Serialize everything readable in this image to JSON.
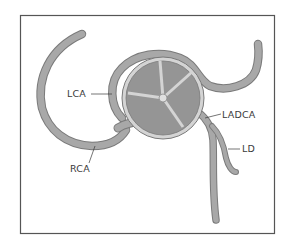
{
  "diagram": {
    "type": "anatomical illustration",
    "labels": {
      "lca": "LCA",
      "rca": "RCA",
      "ladca": "LADCA",
      "ld": "LD"
    },
    "colors": {
      "vessel_fill": "#a8a8a8",
      "vessel_outline": "#7a7a7a",
      "valve_leaflet": "#959595",
      "valve_ring": "#d4d4d4",
      "frame": "#555555",
      "background": "#ffffff",
      "label_text": "#3a3a3a"
    }
  }
}
